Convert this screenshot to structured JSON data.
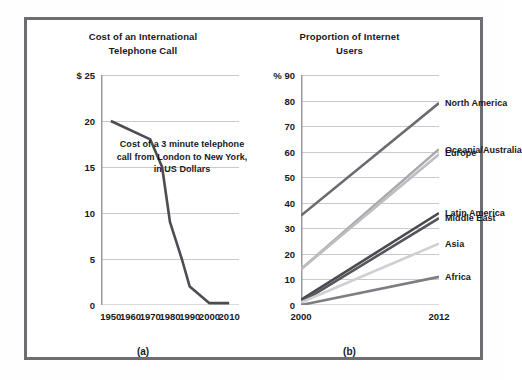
{
  "figure": {
    "background_color": "#ffffff",
    "frame_color": "#6e6e72"
  },
  "panels": [
    {
      "caption": "(a)",
      "title": "Cost of an International Telephone Call",
      "title_line1": "Cost of an International",
      "title_line2": "Telephone Call",
      "y_unit": "$",
      "annotation_line1": "Cost of a 3 minute telephone",
      "annotation_line2": "call from London to New York,",
      "annotation_line3": "in US Dollars"
    },
    {
      "caption": "(b)",
      "title": "Proportion of Internet Users",
      "title_line1": "Proportion of Internet",
      "title_line2": "Users",
      "y_unit": "%"
    }
  ],
  "chart_data": [
    {
      "type": "line",
      "panel": "(a)",
      "title": "Cost of an International Telephone Call",
      "xlabel": "",
      "ylabel": "$",
      "xlim": [
        1945,
        2015
      ],
      "ylim": [
        0,
        25
      ],
      "xticks": [
        1950,
        1960,
        1970,
        1980,
        1990,
        2000,
        2010
      ],
      "yticks": [
        0,
        5,
        10,
        15,
        20,
        25
      ],
      "ytick_labels": [
        "0",
        "5",
        "10",
        "15",
        "20",
        "$ 25"
      ],
      "grid": true,
      "legend": "none",
      "annotation": "Cost of a 3 minute telephone call from London to New York, in US Dollars",
      "series": [
        {
          "name": "Cost of a 3 minute call London to New York (US Dollars)",
          "color": "#4c4c52",
          "x": [
            1950,
            1970,
            1976,
            1980,
            1986,
            1990,
            2000,
            2010
          ],
          "values": [
            20,
            18,
            15,
            9,
            5,
            2,
            0.2,
            0.2
          ]
        }
      ]
    },
    {
      "type": "line",
      "panel": "(b)",
      "title": "Proportion of Internet Users",
      "xlabel": "",
      "ylabel": "%",
      "xlim": [
        2000,
        2012
      ],
      "ylim": [
        0,
        90
      ],
      "xticks": [
        2000,
        2012
      ],
      "yticks": [
        0,
        10,
        20,
        30,
        40,
        50,
        60,
        70,
        80,
        90
      ],
      "ytick_labels": [
        "0",
        "10",
        "20",
        "30",
        "40",
        "50",
        "60",
        "70",
        "80",
        "% 90"
      ],
      "grid": true,
      "legend": "right-inline-labels",
      "categories": [
        2000,
        2012
      ],
      "series": [
        {
          "name": "North America",
          "color": "#6a6a70",
          "values": [
            35,
            79
          ]
        },
        {
          "name": "Oceania/Australia",
          "color": "#a8a8ad",
          "values": [
            14,
            61
          ]
        },
        {
          "name": "Europe",
          "color": "#bdbdc2",
          "values": [
            14,
            59
          ]
        },
        {
          "name": "Latin America",
          "color": "#4a4a50",
          "values": [
            2,
            36
          ]
        },
        {
          "name": "Middle East",
          "color": "#55555b",
          "values": [
            1,
            34
          ]
        },
        {
          "name": "Asia",
          "color": "#cfcfd4",
          "values": [
            1,
            24
          ]
        },
        {
          "name": "Africa",
          "color": "#7d7d83",
          "values": [
            0,
            11
          ]
        }
      ]
    }
  ]
}
